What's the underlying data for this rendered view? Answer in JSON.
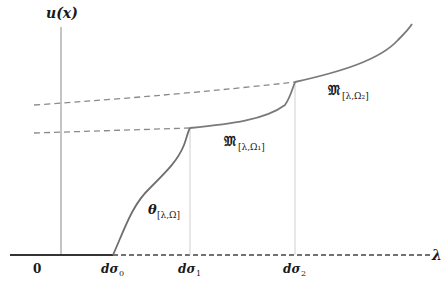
{
  "diagram": {
    "y_axis_label": "u(x)",
    "x_axis_label": "λ",
    "x_ticks": [
      {
        "label": "0",
        "x": 37
      },
      {
        "label": "dσ",
        "sub": "0",
        "x": 113
      },
      {
        "label": "dσ",
        "sub": "1",
        "x": 190
      },
      {
        "label": "dσ",
        "sub": "2",
        "x": 295
      }
    ],
    "curve_labels": {
      "theta": {
        "main": "θ",
        "sub": "[λ,Ω]"
      },
      "m1": {
        "main": "𝔐",
        "sub": "[λ,Ω₁]"
      },
      "m2": {
        "main": "𝔐",
        "sub": "[λ,Ω₂]"
      }
    },
    "colors": {
      "axis": "#888888",
      "curve": "#777777",
      "baseline": "#333333",
      "dashed": "#888888",
      "guide": "#cccccc"
    }
  }
}
